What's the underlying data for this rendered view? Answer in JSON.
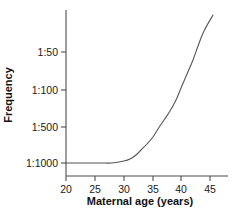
{
  "chart_data": {
    "type": "line",
    "title": "",
    "xlabel": "Maternal age (years)",
    "ylabel": "Frequency",
    "xlim": [
      20,
      48
    ],
    "ylim_labels_top_to_bottom": [
      "1:50",
      "1:100",
      "1:500",
      "1:1000"
    ],
    "x_ticks": [
      20,
      25,
      30,
      35,
      40,
      45
    ],
    "x_tick_labels": [
      "20",
      "25",
      "30",
      "35",
      "40",
      "45"
    ],
    "y_ticks": [
      "1:50",
      "1:100",
      "1:500",
      "1:1000"
    ],
    "y_tick_labels": [
      "1:50",
      "1:100",
      "1:500",
      "1:1000"
    ],
    "grid": false,
    "legend": false,
    "legend_position": "none",
    "series": [
      {
        "name": "Down syndrome frequency by maternal age",
        "x": [
          20,
          22,
          24,
          26,
          28,
          30,
          31,
          32,
          33,
          34,
          35,
          36,
          37,
          38,
          39,
          40,
          41,
          42,
          43,
          44,
          45
        ],
        "y_labels": [
          "1:1000",
          "1:1000",
          "1:1000",
          "1:1000",
          "1:1000",
          "1:950",
          "1:900",
          "1:820",
          "1:720",
          "1:610",
          "1:500",
          "1:420",
          "1:350",
          "1:280",
          "1:220",
          "1:170",
          "1:130",
          "1:100",
          "1:75",
          "1:55",
          "1:40"
        ],
        "pixel_points": [
          [
            66,
            163
          ],
          [
            78,
            163
          ],
          [
            89,
            163
          ],
          [
            101,
            163
          ],
          [
            112,
            163
          ],
          [
            124,
            161
          ],
          [
            130,
            159
          ],
          [
            136,
            155
          ],
          [
            141,
            150
          ],
          [
            147,
            144
          ],
          [
            153,
            137
          ],
          [
            158,
            129
          ],
          [
            164,
            120
          ],
          [
            170,
            111
          ],
          [
            176,
            100
          ],
          [
            181,
            88
          ],
          [
            187,
            74
          ],
          [
            193,
            60
          ],
          [
            198,
            46
          ],
          [
            204,
            31
          ],
          [
            213,
            15
          ]
        ],
        "color": "#555555",
        "line_width": 1.1
      }
    ],
    "axes_pixel_geometry": {
      "x_axis_y": 176,
      "y_axis_x": 66,
      "x_axis_x_start": 66,
      "x_axis_x_end": 228,
      "y_axis_y_top": 10,
      "y_axis_y_bottom": 176,
      "x_tick_pixels": [
        66,
        95,
        124,
        153,
        181,
        210
      ],
      "y_tick_pixels": [
        52,
        90,
        127,
        163
      ]
    }
  },
  "figure": {
    "background_color": "#ffffff",
    "axis_color": "#4d4d4d",
    "text_color": "#1a1a1a"
  }
}
